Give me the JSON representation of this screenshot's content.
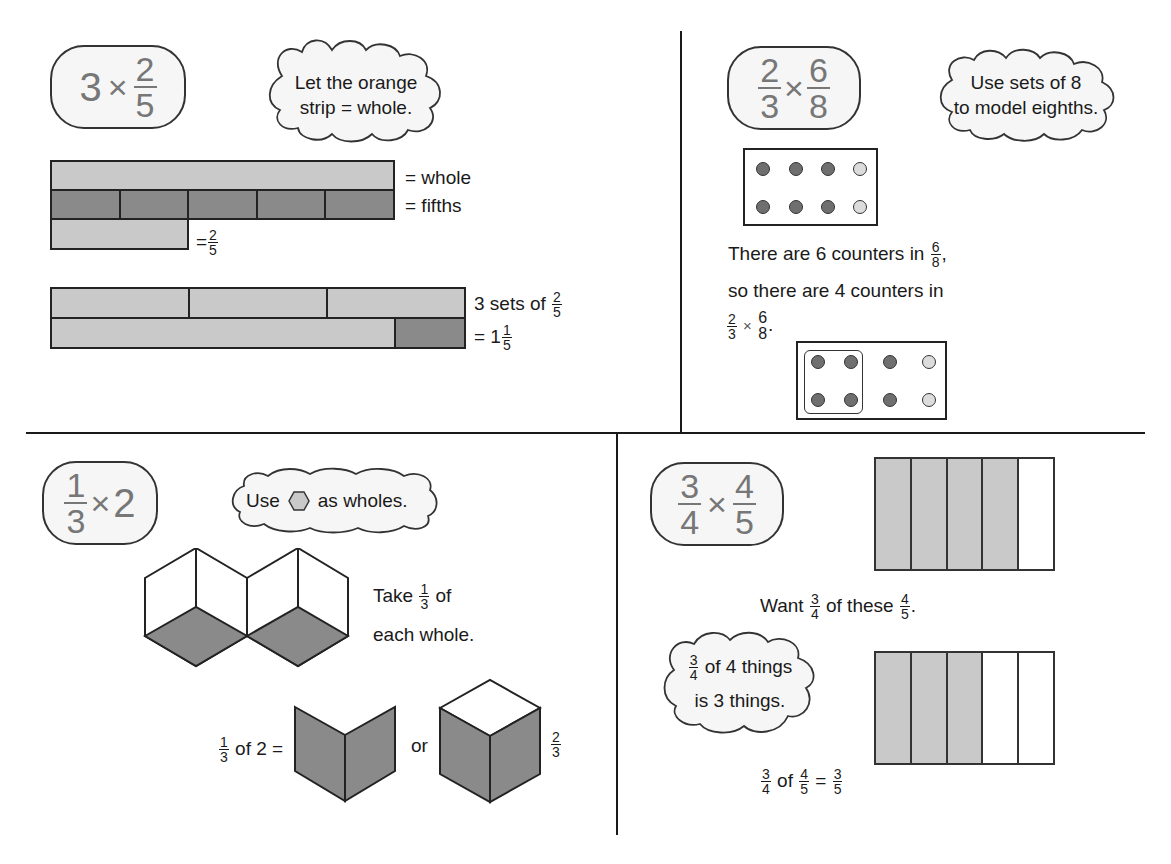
{
  "colors": {
    "line": "#1a1a1a",
    "light_fill": "#c9c9c9",
    "dark_fill": "#8a8a8a",
    "counter_dark": "#6f6f6f",
    "counter_light": "#dcdcdc",
    "pill_text": "#777777"
  },
  "q1": {
    "expression": {
      "whole": "3",
      "times": "×",
      "num": "2",
      "den": "5"
    },
    "cloud": {
      "line1": "Let the orange",
      "line2": "strip = whole."
    },
    "labels": {
      "whole": "= whole",
      "fifths": "=  fifths",
      "two_fifths_eq": "=",
      "two_fifths_num": "2",
      "two_fifths_den": "5",
      "sets_prefix": "3 sets of",
      "sets_num": "2",
      "sets_den": "5",
      "result_prefix": "= 1",
      "result_num": "1",
      "result_den": "5"
    }
  },
  "q2": {
    "expression": {
      "a_num": "2",
      "a_den": "3",
      "times": "×",
      "b_num": "6",
      "b_den": "8"
    },
    "cloud": {
      "line1": "Use sets of 8",
      "line2": "to model eighths."
    },
    "text": {
      "line1_prefix": "There are 6 counters in",
      "line1_num": "6",
      "line1_den": "8",
      "line1_suffix": ",",
      "line2": "so there are 4 counters in",
      "line3_a_num": "2",
      "line3_a_den": "3",
      "line3_times": "×",
      "line3_b_num": "6",
      "line3_b_den": "8",
      "line3_suffix": "."
    },
    "counters_top": [
      "dark",
      "dark",
      "dark",
      "light",
      "dark",
      "dark",
      "dark",
      "light"
    ],
    "counters_bottom": [
      "dark",
      "dark",
      "dark",
      "light",
      "dark",
      "dark",
      "dark",
      "light"
    ]
  },
  "q3": {
    "expression": {
      "num": "1",
      "den": "3",
      "times": "×",
      "whole": "2"
    },
    "cloud": {
      "prefix": "Use",
      "suffix": "as wholes.",
      "icon": "hexagon-icon"
    },
    "text": {
      "take_prefix": "Take",
      "take_num": "1",
      "take_den": "3",
      "take_suffix": "of",
      "line2": "each whole.",
      "eq_num": "1",
      "eq_den": "3",
      "eq_suffix": "of 2 =",
      "or": "or",
      "result_num": "2",
      "result_den": "3"
    }
  },
  "q4": {
    "expression": {
      "a_num": "3",
      "a_den": "4",
      "times": "×",
      "b_num": "4",
      "b_den": "5"
    },
    "text": {
      "want_prefix": "Want",
      "want_num": "3",
      "want_den": "4",
      "want_mid": "of these",
      "want_num2": "4",
      "want_den2": "5",
      "want_suffix": "."
    },
    "cloud": {
      "line1_num": "3",
      "line1_den": "4",
      "line1_suffix": "of 4 things",
      "line2": "is 3 things."
    },
    "result": {
      "a_num": "3",
      "a_den": "4",
      "of": "of",
      "b_num": "4",
      "b_den": "5",
      "eq": "=",
      "c_num": "3",
      "c_den": "5"
    },
    "grid_top": [
      "light",
      "light",
      "light",
      "light",
      "white"
    ],
    "grid_bottom": [
      "light",
      "light",
      "light",
      "white",
      "white"
    ]
  }
}
